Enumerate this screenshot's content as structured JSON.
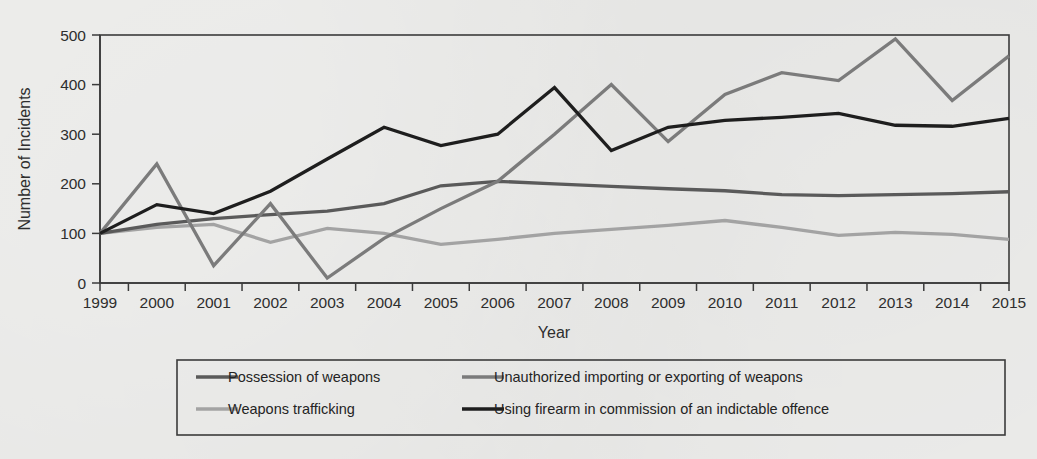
{
  "chart_data": {
    "type": "line",
    "title": "",
    "xlabel": "Year",
    "ylabel": "Number of Incidents",
    "ylim": [
      0,
      500
    ],
    "yticks": [
      0,
      100,
      200,
      300,
      400,
      500
    ],
    "grid": false,
    "legend_position": "bottom",
    "categories": [
      "1999",
      "2000",
      "2001",
      "2002",
      "2003",
      "2004",
      "2005",
      "2006",
      "2007",
      "2008",
      "2009",
      "2010",
      "2011",
      "2012",
      "2013",
      "2014",
      "2015"
    ],
    "series": [
      {
        "name": "Possession of weapons",
        "color": "#5a5a5a",
        "values": [
          100,
          118,
          130,
          138,
          145,
          160,
          196,
          205,
          200,
          195,
          190,
          186,
          178,
          176,
          178,
          180,
          184
        ]
      },
      {
        "name": "Unauthorized importing or exporting of weapons",
        "color": "#7b7b7b",
        "values": [
          100,
          240,
          35,
          160,
          10,
          90,
          150,
          205,
          300,
          400,
          285,
          380,
          424,
          408,
          492,
          368,
          458
        ]
      },
      {
        "name": "Weapons trafficking",
        "color": "#a3a3a3",
        "values": [
          100,
          112,
          118,
          82,
          110,
          100,
          78,
          88,
          100,
          108,
          116,
          126,
          112,
          96,
          102,
          98,
          88
        ]
      },
      {
        "name": "Using firearm in commission of an indictable offence",
        "color": "#1e1e1e",
        "values": [
          100,
          158,
          140,
          185,
          250,
          314,
          277,
          300,
          394,
          267,
          314,
          328,
          334,
          342,
          318,
          316,
          332
        ]
      }
    ]
  },
  "legend": {
    "entries": [
      {
        "label": "Possession of weapons",
        "color": "#5a5a5a"
      },
      {
        "label": "Unauthorized importing or exporting of weapons",
        "color": "#7b7b7b"
      },
      {
        "label": "Weapons trafficking",
        "color": "#a3a3a3"
      },
      {
        "label": "Using firearm in commission of an indictable offence",
        "color": "#1e1e1e"
      }
    ]
  }
}
